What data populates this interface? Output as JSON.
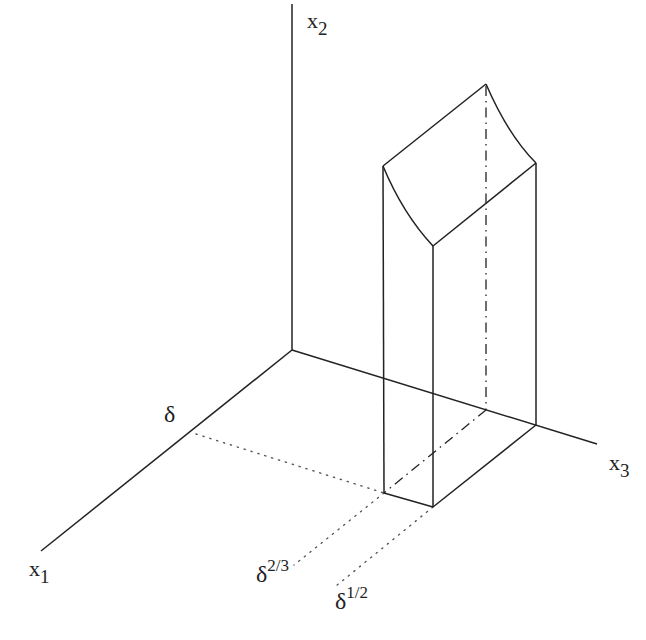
{
  "diagram": {
    "type": "3d-box-with-curved-top",
    "stroke_color": "#222222",
    "axes": {
      "x1": {
        "label": "x",
        "subscript": "1"
      },
      "x2": {
        "label": "x",
        "subscript": "2"
      },
      "x3": {
        "label": "x",
        "subscript": "3"
      }
    },
    "tick_labels": {
      "delta": {
        "base": "δ",
        "sup": ""
      },
      "delta_2_3": {
        "base": "δ",
        "sup": "2/3"
      },
      "delta_1_2": {
        "base": "δ",
        "sup": "1/2"
      }
    }
  }
}
